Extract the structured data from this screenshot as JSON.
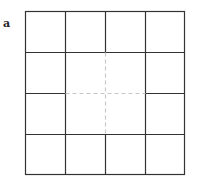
{
  "figure": {
    "panel_label": "a",
    "grid": {
      "rows": 4,
      "cols": 4,
      "left": 25.5,
      "top": 11.5,
      "right": 184.5,
      "bottom": 174.5,
      "x_lines": [
        25.5,
        65.5,
        105.5,
        145.5,
        184.5
      ],
      "y_lines": [
        11.5,
        52.5,
        93.5,
        134.5,
        174.5
      ],
      "solid_color": "#333333",
      "dashed_color": "#c8c8c8",
      "inner_region": "center 2x2 block with dashed dividing cross"
    }
  }
}
